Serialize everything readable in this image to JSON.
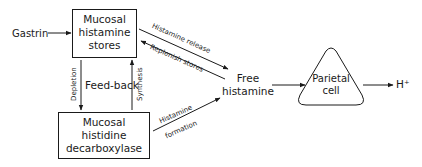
{
  "diagram": {
    "inputs": {
      "gastrin": "Gastrin"
    },
    "nodes": {
      "histamine_stores": {
        "lines": [
          "Mucosal",
          "histamine",
          "stores"
        ]
      },
      "histidine_decarboxylase": {
        "lines": [
          "Mucosal",
          "histidine",
          "decarboxylase"
        ]
      },
      "free_histamine": {
        "lines": [
          "Free",
          "histamine"
        ]
      },
      "parietal_cell": {
        "lines": [
          "Parietal",
          "cell"
        ]
      },
      "output": "H⁺"
    },
    "edge_labels": {
      "histamine_release": "Histamine release",
      "replenish_stores": "Replenish stores",
      "depletion": "Depletion",
      "synthesis": "Synthesis",
      "feedback": "Feed-back",
      "histamine": "Histamine",
      "formation": "formation"
    },
    "colors": {
      "ink": "#1a1a1a",
      "background": "#ffffff"
    }
  }
}
